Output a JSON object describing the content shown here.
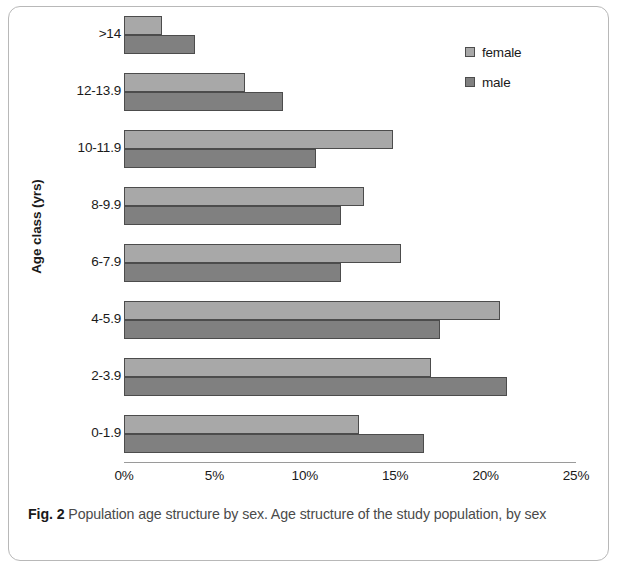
{
  "figure": {
    "caption_label": "Fig. 2",
    "caption_text": "Population age structure by sex. Age structure of the study population, by sex"
  },
  "legend": {
    "position": "top-right",
    "items": [
      {
        "label": "female",
        "color": "#a8a8a8"
      },
      {
        "label": "male",
        "color": "#808080"
      }
    ]
  },
  "axes": {
    "y_title": "Age class (yrs)",
    "x_title": ""
  },
  "chart_data": {
    "type": "bar",
    "orientation": "horizontal",
    "title": "",
    "subtitle": "",
    "xlabel": "",
    "ylabel": "Age class (yrs)",
    "xlim": [
      0,
      25
    ],
    "xticks": [
      0,
      5,
      10,
      15,
      20,
      25
    ],
    "xtick_labels": [
      "0%",
      "5%",
      "10%",
      "15%",
      "20%",
      "25%"
    ],
    "grid": false,
    "legend_position": "top-right",
    "unit": "%",
    "categories": [
      ">14",
      "12-13.9",
      "10-11.9",
      "8-9.9",
      "6-7.9",
      "4-5.9",
      "2-3.9",
      "0-1.9"
    ],
    "series": [
      {
        "name": "female",
        "color": "#a8a8a8",
        "values": [
          2.1,
          6.7,
          14.9,
          13.3,
          15.3,
          20.8,
          17.0,
          13.0
        ]
      },
      {
        "name": "male",
        "color": "#808080",
        "values": [
          3.9,
          8.8,
          10.6,
          12.0,
          12.0,
          17.5,
          21.2,
          16.6
        ]
      }
    ]
  }
}
